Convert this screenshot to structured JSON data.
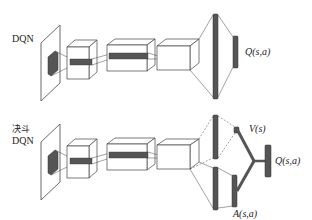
{
  "diagrams": [
    {
      "label": "DQN",
      "output_label": "Q(s,a)"
    },
    {
      "label_line1": "决斗",
      "label_line2": "DQN",
      "value_label": "V(s)",
      "advantage_label": "A(s,a)",
      "output_label": "Q(s,a)"
    }
  ],
  "colors": {
    "stroke": "#444444",
    "dark_block": "#555555",
    "background": "#ffffff"
  }
}
